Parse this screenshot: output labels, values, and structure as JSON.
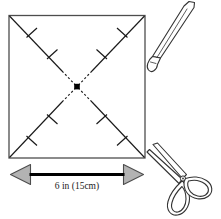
{
  "diagram": {
    "background_color": "#ffffff",
    "square": {
      "name": "paper-square",
      "stroke_color": "#4d4d4d",
      "fill_color": "#ffffff",
      "side_label": "6 in (15cm)"
    },
    "dimension": {
      "label": "6 in (15cm)",
      "arrow_fill_color": "#b3b3b3",
      "arrow_stroke_color": "#4d4d4d",
      "line_color": "#000000"
    },
    "diagonals": {
      "name": "fold-diagonals",
      "solid_color": "#1a1a1a",
      "dashed_color": "#1a1a1a",
      "tick_count_per_arm": 2,
      "tick_color": "#1a1a1a"
    },
    "center_point": {
      "name": "center-marker",
      "color": "#000000",
      "shape": "filled-square"
    },
    "scissors_top": {
      "name": "scissors-blade-top",
      "stroke_color": "#333333",
      "fill_color": "#ffffff"
    },
    "scissors_bottom": {
      "name": "scissors-bottom",
      "stroke_color": "#333333",
      "fill_color": "#ffffff"
    }
  }
}
